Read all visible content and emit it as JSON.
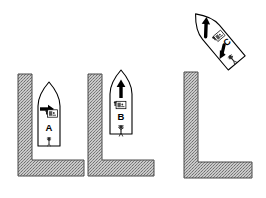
{
  "figure": {
    "background_color": "#ffffff",
    "line_color": "#000000",
    "wall_fill_color": "#b0b0b0",
    "wall_edge_color": "#4a4a4a",
    "arrow_color": "#000000",
    "panels": [
      {
        "id": "panel-a",
        "boat_label": "A",
        "boat_rotation_deg": 0,
        "wall_shape": "L-shaped quay, vertical leg on left, horizontal leg along bottom",
        "arrows": [
          {
            "name": "thrust-arrow",
            "direction": "right",
            "meaning": "lateral thrust toward wall"
          }
        ],
        "icons": [
          {
            "name": "helm-console-icon",
            "label": ""
          },
          {
            "name": "crew-figure-icon",
            "label": ""
          }
        ]
      },
      {
        "id": "panel-b",
        "boat_label": "B",
        "boat_rotation_deg": 0,
        "wall_shape": "L-shaped quay, vertical leg on left, horizontal leg along bottom",
        "arrows": [
          {
            "name": "forward-arrow",
            "direction": "up",
            "meaning": "forward motion ahead"
          }
        ],
        "icons": [
          {
            "name": "helm-console-icon",
            "label": ""
          },
          {
            "name": "crew-figure-icon",
            "label": ""
          }
        ]
      },
      {
        "id": "panel-c",
        "boat_label": "C",
        "boat_rotation_deg": -40,
        "wall_shape": "L-shaped quay, vertical leg on left, horizontal leg along bottom",
        "arrows": [
          {
            "name": "forward-arrow",
            "direction": "up-right",
            "meaning": "forward motion away from quay"
          },
          {
            "name": "stern-swing-arrow",
            "direction": "down-left",
            "meaning": "stern swings toward quay"
          }
        ],
        "icons": [
          {
            "name": "helm-console-icon",
            "label": ""
          },
          {
            "name": "crew-figure-icon",
            "label": ""
          }
        ]
      }
    ]
  }
}
